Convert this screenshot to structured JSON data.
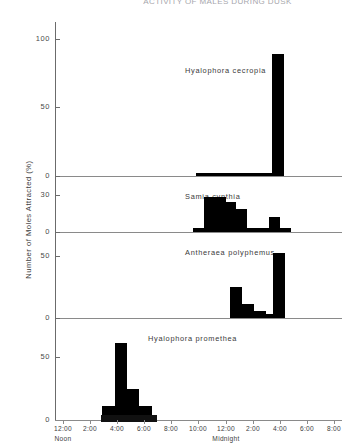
{
  "figure": {
    "title": "ACTIVITY OF MALES DURING DUSK",
    "y_axis_title": "Number of Moles Attracted (%)",
    "noon_label": "Noon",
    "midnight_label": "Midnight"
  },
  "x_axis": {
    "tick_labels": [
      "12:00",
      "2:00",
      "4:00",
      "6:00",
      "8:00",
      "10:00",
      "12:00",
      "2:00",
      "4:00",
      "6:00",
      "8:00"
    ],
    "tick_hours": [
      12,
      14,
      16,
      18,
      20,
      22,
      24,
      26,
      28,
      30,
      32
    ],
    "range_hours": [
      11.4,
      32.6
    ],
    "night_band_hours": [
      14.8,
      18.9
    ]
  },
  "panels": [
    {
      "species": "Hyalophora cecropia",
      "y_ticks": [
        0,
        50,
        100
      ],
      "y_max": 112,
      "bars": [
        {
          "start": 21.8,
          "end": 22.6,
          "value": 2
        },
        {
          "start": 22.6,
          "end": 23.4,
          "value": 2
        },
        {
          "start": 23.4,
          "end": 24.2,
          "value": 2
        },
        {
          "start": 24.2,
          "end": 25.0,
          "value": 2
        },
        {
          "start": 25.0,
          "end": 25.8,
          "value": 2
        },
        {
          "start": 25.8,
          "end": 26.6,
          "value": 2
        },
        {
          "start": 26.6,
          "end": 27.4,
          "value": 2
        },
        {
          "start": 27.4,
          "end": 28.3,
          "value": 89
        }
      ]
    },
    {
      "species": "Samia cynthia",
      "y_ticks": [
        0,
        30
      ],
      "y_max": 34,
      "bars": [
        {
          "start": 21.6,
          "end": 22.4,
          "value": 3
        },
        {
          "start": 22.4,
          "end": 23.2,
          "value": 28
        },
        {
          "start": 23.2,
          "end": 24.0,
          "value": 28
        },
        {
          "start": 24.0,
          "end": 24.8,
          "value": 24
        },
        {
          "start": 24.8,
          "end": 25.6,
          "value": 19
        },
        {
          "start": 25.6,
          "end": 26.4,
          "value": 3
        },
        {
          "start": 26.4,
          "end": 27.2,
          "value": 3
        },
        {
          "start": 27.2,
          "end": 28.0,
          "value": 12
        },
        {
          "start": 28.0,
          "end": 28.8,
          "value": 3
        }
      ]
    },
    {
      "species": "Antheraea polyphemus",
      "y_ticks": [
        0,
        50
      ],
      "y_max": 58,
      "bars": [
        {
          "start": 24.3,
          "end": 25.2,
          "value": 25
        },
        {
          "start": 25.2,
          "end": 26.1,
          "value": 11
        },
        {
          "start": 26.1,
          "end": 27.0,
          "value": 6
        },
        {
          "start": 27.0,
          "end": 27.5,
          "value": 3
        },
        {
          "start": 27.5,
          "end": 28.4,
          "value": 52
        }
      ]
    },
    {
      "species": "Hyalophora promethea",
      "y_ticks": [
        0,
        50
      ],
      "y_max": 70,
      "bars": [
        {
          "start": 14.9,
          "end": 15.8,
          "value": 11
        },
        {
          "start": 15.8,
          "end": 16.7,
          "value": 61
        },
        {
          "start": 16.7,
          "end": 17.6,
          "value": 25
        },
        {
          "start": 17.6,
          "end": 18.6,
          "value": 11
        }
      ]
    }
  ],
  "chart_data": {
    "type": "bar",
    "title": "ACTIVITY OF MALES DURING DUSK",
    "xlabel": "Time of day (Noon through Midnight to 8:00)",
    "ylabel": "Number of Moles Attracted (%)",
    "grid": false,
    "legend": "none",
    "subplots": [
      {
        "name": "Hyalophora cecropia",
        "ylim": [
          0,
          112
        ],
        "yticks": [
          0,
          50,
          100
        ],
        "categories": [
          "10:00 PM",
          "11:00 PM",
          "12:00 AM",
          "1:00 AM",
          "2:00 AM",
          "3:00 AM",
          "4:00 AM"
        ],
        "values": [
          2,
          2,
          2,
          2,
          2,
          2,
          89
        ]
      },
      {
        "name": "Samia cynthia",
        "ylim": [
          0,
          34
        ],
        "yticks": [
          0,
          30
        ],
        "categories": [
          "10:00 PM",
          "11:00 PM",
          "12:00 AM",
          "1:00 AM",
          "2:00 AM",
          "3:00 AM",
          "4:00 AM",
          "5:00 AM"
        ],
        "values": [
          3,
          28,
          28,
          24,
          19,
          3,
          12,
          3
        ]
      },
      {
        "name": "Antheraea polyphemus",
        "ylim": [
          0,
          58
        ],
        "yticks": [
          0,
          50
        ],
        "categories": [
          "12:00 AM",
          "1:00 AM",
          "2:00 AM",
          "3:00 AM",
          "4:00 AM"
        ],
        "values": [
          25,
          11,
          6,
          3,
          52
        ]
      },
      {
        "name": "Hyalophora promethea",
        "ylim": [
          0,
          70
        ],
        "yticks": [
          0,
          50
        ],
        "categories": [
          "3:00 PM",
          "4:00 PM",
          "5:00 PM",
          "6:00 PM"
        ],
        "values": [
          11,
          61,
          25,
          11
        ]
      }
    ]
  }
}
